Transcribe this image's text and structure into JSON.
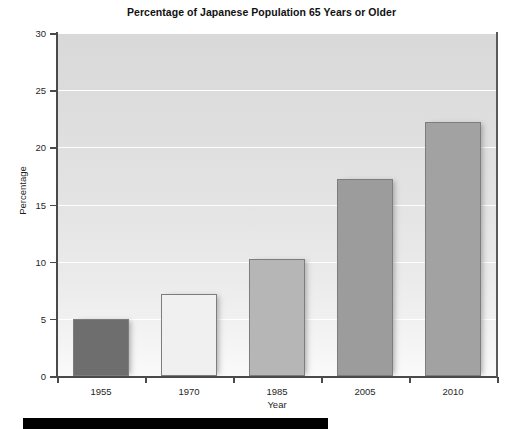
{
  "chart_data": {
    "type": "bar",
    "title": "Percentage of Japanese Population 65 Years or Older",
    "xlabel": "Year",
    "ylabel": "Percentage",
    "categories": [
      "1955",
      "1970",
      "1985",
      "2005",
      "2010"
    ],
    "values": [
      5.0,
      7.2,
      10.2,
      17.2,
      22.2
    ],
    "ylim": [
      0,
      30
    ],
    "yticks": [
      "0",
      "5",
      "10",
      "15",
      "20",
      "25",
      "30"
    ],
    "ytick_values": [
      0,
      5,
      10,
      15,
      20,
      25,
      30
    ],
    "grid": true,
    "legend": "none",
    "bar_colors": [
      "#6e6e6e",
      "#f0f0f0",
      "#b6b6b6",
      "#9c9c9c",
      "#a2a2a2"
    ],
    "plot_background": "#e2e2e2",
    "gridline_color": "#ffffff",
    "axis_color": "#4a4a4a"
  },
  "footer": {
    "band_color": "#000000"
  }
}
